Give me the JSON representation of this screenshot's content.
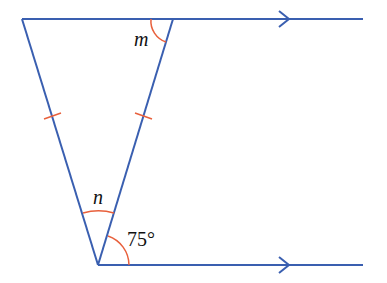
{
  "diagram": {
    "type": "geometry",
    "labels": {
      "angle_top": "m",
      "angle_apex": "n",
      "angle_given": "75°"
    },
    "colors": {
      "line": "#3a5fb0",
      "mark": "#e8603c",
      "text": "#111111"
    },
    "parallel_marks": 2,
    "equal_side_ticks": 2
  }
}
